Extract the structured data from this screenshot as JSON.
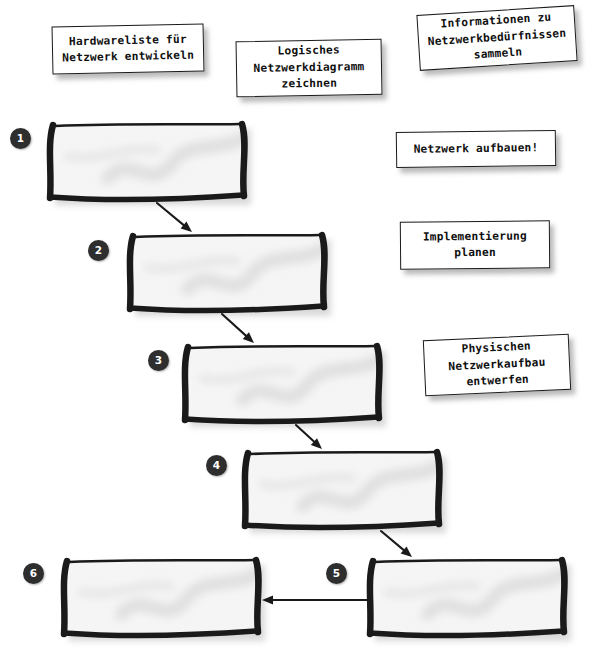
{
  "diagram": {
    "background_color": "#ffffff",
    "ink_color": "#1a1a1a",
    "bar_fill_color": "#f5f5f5",
    "bar_smudge_color": "#dcdcdc",
    "badge_color": "#2e2e2e",
    "badge_text_color": "#ffffff"
  },
  "notes": [
    {
      "id": "note-hardwareliste",
      "text": "Hardwareliste für\nNetzwerk entwickeln",
      "x": 52,
      "y": 25,
      "width": 152,
      "height": 48,
      "rotation": -1.2
    },
    {
      "id": "note-logisches-diagramm",
      "text": "Logisches\nNetzwerkdiagramm\nzeichnen",
      "x": 236,
      "y": 40,
      "width": 146,
      "height": 56,
      "rotation": -1.0
    },
    {
      "id": "note-informationen",
      "text": "Informationen zu\nNetzwerkbedürfnissen\nsammeln",
      "x": 418,
      "y": 10,
      "width": 158,
      "height": 56,
      "rotation": -3.6
    },
    {
      "id": "note-netzwerk-aufbauen",
      "text": "Netzwerk aufbauen!",
      "x": 396,
      "y": 131,
      "width": 160,
      "height": 36,
      "rotation": -0.8
    },
    {
      "id": "note-implementierung",
      "text": "Implementierung\nplanen",
      "x": 400,
      "y": 221,
      "width": 150,
      "height": 48,
      "rotation": -0.5
    },
    {
      "id": "note-physischen-aufbau",
      "text": "Physischen\nNetzwerkaufbau\nentwerfen",
      "x": 424,
      "y": 337,
      "width": 146,
      "height": 56,
      "rotation": -2.6
    }
  ],
  "steps": [
    {
      "number": "1",
      "badge_x": 10,
      "badge_y": 128,
      "bar_x": 48,
      "bar_y": 122,
      "bar_w": 198,
      "bar_h": 78
    },
    {
      "number": "2",
      "badge_x": 88,
      "badge_y": 240,
      "bar_x": 128,
      "bar_y": 233,
      "bar_w": 198,
      "bar_h": 78
    },
    {
      "number": "3",
      "badge_x": 148,
      "badge_y": 350,
      "bar_x": 183,
      "bar_y": 344,
      "bar_w": 198,
      "bar_h": 78
    },
    {
      "number": "4",
      "badge_x": 206,
      "badge_y": 455,
      "bar_x": 243,
      "bar_y": 450,
      "bar_w": 198,
      "bar_h": 78
    },
    {
      "number": "5",
      "badge_x": 326,
      "badge_y": 563,
      "bar_x": 368,
      "bar_y": 558,
      "bar_w": 198,
      "bar_h": 78
    },
    {
      "number": "6",
      "badge_x": 23,
      "badge_y": 563,
      "bar_x": 62,
      "bar_y": 558,
      "bar_w": 198,
      "bar_h": 78
    }
  ],
  "arrows": [
    {
      "id": "arrow-1-to-2",
      "from_step": "1",
      "to_step": "2",
      "x1": 157,
      "y1": 203,
      "x2": 192,
      "y2": 232,
      "direction": "down-right"
    },
    {
      "id": "arrow-2-to-3",
      "from_step": "2",
      "to_step": "3",
      "x1": 222,
      "y1": 314,
      "x2": 254,
      "y2": 343,
      "direction": "down-right"
    },
    {
      "id": "arrow-3-to-4",
      "from_step": "3",
      "to_step": "4",
      "x1": 296,
      "y1": 425,
      "x2": 322,
      "y2": 449,
      "direction": "down-right"
    },
    {
      "id": "arrow-4-to-5",
      "from_step": "4",
      "to_step": "5",
      "x1": 381,
      "y1": 531,
      "x2": 412,
      "y2": 557,
      "direction": "down-right"
    },
    {
      "id": "arrow-5-to-6",
      "from_step": "5",
      "to_step": "6",
      "x1": 368,
      "y1": 600,
      "x2": 262,
      "y2": 600,
      "direction": "left"
    }
  ]
}
